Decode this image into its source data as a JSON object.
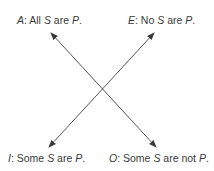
{
  "diagram": {
    "line_color": "#555555",
    "text_color": "#3a3a3a",
    "corners": {
      "A": {
        "letter": "A",
        "sep": ": ",
        "pre": "All ",
        "s": "S",
        "mid": " are ",
        "p": "P",
        "end": "."
      },
      "E": {
        "letter": "E",
        "sep": ": ",
        "pre": "No ",
        "s": "S",
        "mid": " are ",
        "p": "P",
        "end": "."
      },
      "I": {
        "letter": "I",
        "sep": ": ",
        "pre": "Some ",
        "s": "S",
        "mid": " are ",
        "p": "P",
        "end": "."
      },
      "O": {
        "letter": "O",
        "sep": ": ",
        "pre": "Some ",
        "s": "S",
        "mid": " are not ",
        "p": "P",
        "end": "."
      }
    },
    "arrows": [
      {
        "from": "A",
        "to": "O",
        "type": "double-headed",
        "meaning": "contradictory"
      },
      {
        "from": "E",
        "to": "I",
        "type": "double-headed",
        "meaning": "contradictory"
      }
    ]
  }
}
